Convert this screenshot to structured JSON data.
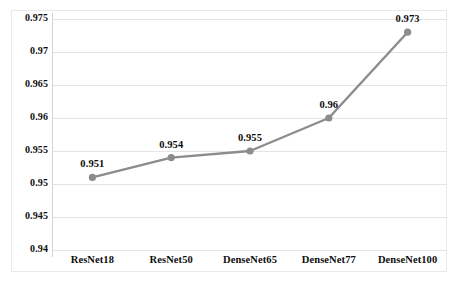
{
  "chart_data": {
    "type": "line",
    "title": "",
    "xlabel": "",
    "ylabel": "",
    "categories": [
      "ResNet18",
      "ResNet50",
      "DenseNet65",
      "DenseNet77",
      "DenseNet100"
    ],
    "values": [
      0.951,
      0.954,
      0.955,
      0.96,
      0.973
    ],
    "point_labels": [
      "0.951",
      "0.954",
      "0.955",
      "0.96",
      "0.973"
    ],
    "ylim": [
      0.94,
      0.975
    ],
    "ytick_values": [
      0.94,
      0.945,
      0.95,
      0.955,
      0.96,
      0.965,
      0.97,
      0.975
    ],
    "ytick_labels": [
      "0.94",
      "0.945",
      "0.95",
      "0.955",
      "0.96",
      "0.965",
      "0.97",
      "0.975"
    ],
    "grid": true,
    "grid_axis": "y",
    "legend": false,
    "legend_position": "none",
    "series_color": "#8c8c8c",
    "marker": "circle",
    "gridline_color": "#e4e4e4",
    "axis_color": "#d4d4d4",
    "text_color": "#0d0d0d",
    "background_color": "#ffffff"
  }
}
